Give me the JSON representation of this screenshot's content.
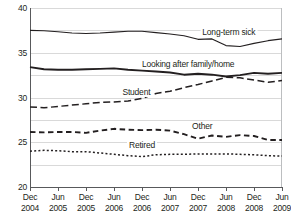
{
  "chart_data": {
    "type": "line",
    "title": "",
    "xlabel": "",
    "ylabel": "",
    "ylim": [
      0,
      40
    ],
    "ytick_step": 5,
    "yticks": [
      "0",
      "5",
      "10",
      "15",
      "20",
      "25",
      "30",
      "35",
      "40"
    ],
    "grid": true,
    "legend_position": "inline-labels",
    "categories": [
      "Dec 2004",
      "Mar 2005",
      "Jun 2005",
      "Sep 2005",
      "Dec 2005",
      "Mar 2006",
      "Jun 2006",
      "Sep 2006",
      "Dec 2006",
      "Mar 2007",
      "Jun 2007",
      "Sep 2007",
      "Dec 2007",
      "Mar 2008",
      "Jun 2008",
      "Sep 2008",
      "Dec 2008",
      "Mar 2009",
      "Jun 2009"
    ],
    "xtick_labels": [
      {
        "month": "Dec",
        "year": "2004"
      },
      {
        "month": "Jun",
        "year": "2005"
      },
      {
        "month": "Dec",
        "year": "2005"
      },
      {
        "month": "Jun",
        "year": "2006"
      },
      {
        "month": "Dec",
        "year": "2006"
      },
      {
        "month": "Jun",
        "year": "2007"
      },
      {
        "month": "Dec",
        "year": "2007"
      },
      {
        "month": "Jun",
        "year": "2008"
      },
      {
        "month": "Dec",
        "year": "2008"
      },
      {
        "month": "Jun",
        "year": "2009"
      }
    ],
    "series": [
      {
        "name": "Long-term sick",
        "style": "solid",
        "label_x_index": 14.2,
        "label_y": 34.6,
        "values": [
          35.0,
          34.9,
          34.7,
          34.4,
          34.3,
          34.4,
          34.6,
          34.8,
          34.8,
          34.5,
          34.2,
          33.8,
          33.0,
          33.1,
          31.6,
          31.4,
          32.1,
          32.7,
          33.1
        ]
      },
      {
        "name": "Looking after family/home",
        "style": "solid-thick",
        "label_x_index": 11.3,
        "label_y": 27.4,
        "values": [
          26.8,
          26.3,
          26.2,
          26.2,
          26.3,
          26.4,
          26.5,
          26.2,
          26.0,
          25.8,
          25.6,
          25.1,
          25.3,
          25.1,
          24.7,
          25.0,
          25.5,
          25.3,
          25.5
        ]
      },
      {
        "name": "Student",
        "style": "long-dash",
        "label_x_index": 7.6,
        "label_y": 21.2,
        "values": [
          17.9,
          17.7,
          18.0,
          18.3,
          18.6,
          18.9,
          19.0,
          19.2,
          19.8,
          20.9,
          21.4,
          22.2,
          22.9,
          23.7,
          24.5,
          24.4,
          23.9,
          23.4,
          23.8
        ]
      },
      {
        "name": "Other",
        "style": "dash",
        "label_x_index": 12.3,
        "label_y": 13.6,
        "values": [
          12.3,
          12.2,
          12.3,
          12.3,
          12.1,
          12.6,
          13.0,
          12.8,
          12.7,
          12.8,
          12.6,
          11.8,
          10.8,
          11.5,
          11.2,
          11.6,
          11.4,
          10.5,
          10.5
        ]
      },
      {
        "name": "Retired",
        "style": "dot",
        "label_x_index": 8.0,
        "label_y": 9.3,
        "values": [
          8.0,
          8.2,
          8.1,
          7.9,
          7.9,
          7.6,
          7.3,
          7.0,
          6.8,
          7.2,
          7.3,
          7.3,
          7.4,
          7.4,
          7.4,
          7.3,
          7.2,
          7.0,
          6.9
        ]
      }
    ]
  }
}
